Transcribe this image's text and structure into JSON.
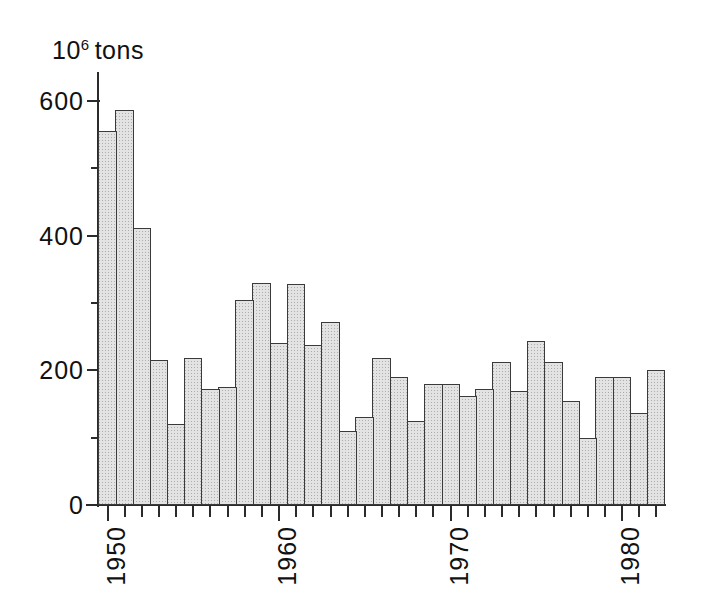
{
  "axes": {
    "y_unit_prefix": "10",
    "y_unit_exponent": "6",
    "y_unit_word": "tons",
    "y_ticks_major": [
      "0",
      "200",
      "400",
      "600"
    ],
    "x_ticks_major": [
      "1950",
      "1960",
      "1970",
      "1980"
    ]
  },
  "chart_data": {
    "type": "bar",
    "title": "",
    "subtitle": "",
    "xlabel": "",
    "ylabel": "10^6 tons",
    "ylim": [
      0,
      640
    ],
    "xlim": [
      1949.5,
      1982.5
    ],
    "grid": false,
    "legend": null,
    "y_major_ticks": [
      0,
      200,
      400,
      600
    ],
    "y_minor_ticks": [
      100,
      300,
      500
    ],
    "x_major_ticks": [
      1950,
      1960,
      1970,
      1980
    ],
    "x_tick_interval": 1,
    "bar_fill_color": "#e3e3e3",
    "bar_edge_color": "#3a3a3a",
    "categories": [
      "1950",
      "1951",
      "1952",
      "1953",
      "1954",
      "1955",
      "1956",
      "1957",
      "1958",
      "1959",
      "1960",
      "1961",
      "1962",
      "1963",
      "1964",
      "1965",
      "1966",
      "1967",
      "1968",
      "1969",
      "1970",
      "1971",
      "1972",
      "1973",
      "1974",
      "1975",
      "1976",
      "1977",
      "1978",
      "1979",
      "1980",
      "1981",
      "1982"
    ],
    "values": [
      555,
      587,
      412,
      215,
      120,
      218,
      172,
      175,
      305,
      330,
      240,
      328,
      237,
      272,
      110,
      130,
      218,
      190,
      125,
      180,
      180,
      162,
      172,
      212,
      170,
      243,
      212,
      155,
      100,
      190,
      190,
      137,
      200
    ]
  }
}
